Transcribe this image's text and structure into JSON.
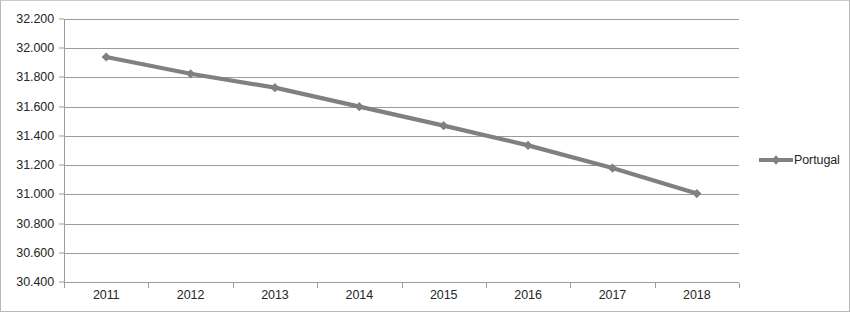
{
  "chart_data": {
    "type": "line",
    "title": "",
    "subtitle": "",
    "xlabel": "",
    "ylabel": "",
    "categories": [
      "2011",
      "2012",
      "2013",
      "2014",
      "2015",
      "2016",
      "2017",
      "2018"
    ],
    "series": [
      {
        "name": "Portugal",
        "values": [
          31.94,
          31.825,
          31.73,
          31.6,
          31.47,
          31.335,
          31.18,
          31.005
        ],
        "color": "#808080",
        "marker": "diamond"
      }
    ],
    "ylim": [
      30.4,
      32.2
    ],
    "ytick_step": 0.2,
    "ytick_labels": [
      "32.200",
      "32.000",
      "31.800",
      "31.600",
      "31.400",
      "31.200",
      "31.000",
      "30.800",
      "30.600",
      "30.400"
    ],
    "ytick_values": [
      32.2,
      32.0,
      31.8,
      31.6,
      31.4,
      31.2,
      31.0,
      30.8,
      30.6,
      30.4
    ],
    "xtick_labels": [
      "2011",
      "2012",
      "2013",
      "2014",
      "2015",
      "2016",
      "2017",
      "2018"
    ],
    "grid": true,
    "grid_axis": "y",
    "legend": {
      "position": "right",
      "entries": [
        {
          "label": "Portugal",
          "color": "#808080",
          "marker": "diamond"
        }
      ]
    },
    "decimal_separator": ".",
    "plot_background": "#ffffff",
    "grid_color": "#9c9c9c",
    "axis_color": "#9c9c9c",
    "border_color": "#b8b8b8",
    "text_color": "#262626"
  }
}
